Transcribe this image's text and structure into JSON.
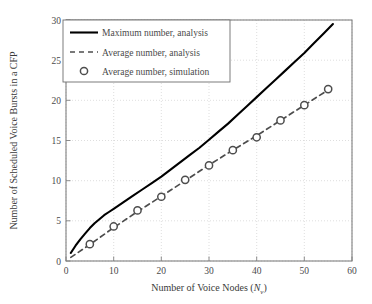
{
  "chart_data": {
    "type": "line",
    "title": "",
    "xlabel": "Number of Voice Nodes (N_v)",
    "xlabel_main": "Number of Voice Nodes (",
    "xlabel_var": "N",
    "xlabel_sub": "v",
    "xlabel_close": ")",
    "ylabel": "Number of Scheduled Voice Bursts in a CFP",
    "xlim": [
      0,
      60
    ],
    "ylim": [
      0,
      30
    ],
    "xticks": [
      0,
      10,
      20,
      30,
      40,
      50,
      60
    ],
    "yticks": [
      0,
      5,
      10,
      15,
      20,
      25,
      30
    ],
    "xtick_labels": [
      "0",
      "10",
      "20",
      "30",
      "40",
      "50",
      "60"
    ],
    "ytick_labels": [
      "0",
      "5",
      "10",
      "15",
      "20",
      "25",
      "30"
    ],
    "grid": true,
    "grid_style": "dotted",
    "grid_color": "#c8c8c8",
    "axis_color": "#808080",
    "legend_position": "top-left",
    "series": [
      {
        "name": "Maximum number, analysis",
        "style": "solid",
        "color": "#000000",
        "marker": "none",
        "x": [
          1,
          2,
          3,
          4,
          5,
          6,
          7,
          8,
          9,
          10,
          12,
          14,
          16,
          18,
          20,
          22,
          24,
          26,
          28,
          30,
          32,
          34,
          36,
          38,
          40,
          42,
          44,
          46,
          48,
          50,
          52,
          54,
          56
        ],
        "y": [
          1.0,
          1.9,
          2.7,
          3.4,
          4.1,
          4.7,
          5.2,
          5.7,
          6.1,
          6.5,
          7.3,
          8.1,
          8.9,
          9.7,
          10.5,
          11.4,
          12.3,
          13.2,
          14.1,
          15.1,
          16.1,
          17.1,
          18.2,
          19.3,
          20.4,
          21.5,
          22.6,
          23.7,
          24.8,
          25.9,
          27.1,
          28.3,
          29.5
        ]
      },
      {
        "name": "Average number, analysis",
        "style": "dashed",
        "color": "#4d4d4d",
        "marker": "none",
        "x": [
          1,
          5,
          10,
          15,
          20,
          25,
          30,
          35,
          40,
          45,
          50,
          55,
          56
        ],
        "y": [
          0.45,
          2.05,
          4.15,
          6.15,
          8.05,
          10.0,
          11.95,
          13.8,
          15.6,
          17.5,
          19.4,
          21.3,
          21.7
        ]
      },
      {
        "name": "Average number, simulation",
        "style": "none",
        "color": "#4d4d4d",
        "marker": "circle",
        "x": [
          5,
          10,
          15,
          20,
          25,
          30,
          35,
          40,
          45,
          50,
          55
        ],
        "y": [
          2.1,
          4.3,
          6.3,
          8.0,
          10.1,
          11.9,
          13.8,
          15.4,
          17.5,
          19.4,
          21.4
        ]
      }
    ],
    "legend_entries": [
      {
        "label": "Maximum number, analysis",
        "type": "line-solid"
      },
      {
        "label": "Average number, analysis",
        "type": "line-dashed"
      },
      {
        "label": "Average number, simulation",
        "type": "marker-circle"
      }
    ]
  }
}
